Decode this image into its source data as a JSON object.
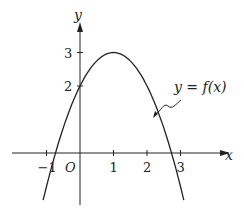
{
  "chart_data": {
    "type": "line",
    "title": "",
    "xlabel": "x",
    "ylabel": "y",
    "origin_label": "O",
    "x_ticks": [
      "-1",
      "1",
      "2",
      "3"
    ],
    "y_ticks": [
      "2",
      "3"
    ],
    "series": [
      {
        "name": "y = f(x)",
        "function": "f(x) = 3 - (x-1)^2",
        "x": [
          -1.1,
          -0.73,
          0,
          1,
          2,
          2.73,
          3.1
        ],
        "values": [
          -1.41,
          0,
          2,
          3,
          2,
          0,
          -1.41
        ]
      }
    ],
    "annotation": "y = f(x)",
    "xlim": [
      -1.9,
      4.3
    ],
    "ylim": [
      -1.6,
      4.4
    ]
  }
}
